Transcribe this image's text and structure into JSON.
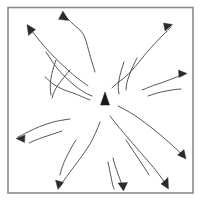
{
  "figure": {
    "background_color": "#ffffff",
    "frame": {
      "label": "square-border",
      "color": "#8a8a8a",
      "stroke_width": 1.6,
      "x": 8,
      "y": 7.5,
      "width": 185,
      "height": 185.5
    },
    "center_marker": {
      "label": "centre-triangle",
      "color": "#1a1a1a",
      "x": 105,
      "y": 103,
      "width": 9,
      "height": 13,
      "points": "105,92 109.5,105 100.5,105"
    },
    "arrow_style": {
      "stroke_color": "#3a3a3a",
      "stroke_width": 0.85,
      "head_color": "#2b2b2b",
      "count": 12
    },
    "arrows": [
      {
        "name": "arrow-north",
        "direction": "north",
        "tip": [
          63,
          12
        ],
        "path": "M 95 72 C 92 62 90 56 88 48 C 86 41 85 35 80 30 C 74 25 68 20 64 14",
        "head": "63,11 68.5,20.5 58.5,19.2"
      },
      {
        "name": "arrow-northwest",
        "direction": "northwest",
        "tip": [
          27,
          25
        ],
        "path": "M 88 86 C 80 80 74 76 68 70 C 60 63 52 55 44 46 C 39 40 33 32 28 27",
        "head": "27,24.5 35.5,29.5 28.5,35.5"
      },
      {
        "name": "arrow-northwest-inner",
        "direction": "northwest-inner",
        "tip": [
          45,
          50
        ],
        "path": "M 92 96 C 86 94 80 90 74 85 C 68 80 62 74 57 68 C 52 62 49 56 46 52",
        "head": null
      },
      {
        "name": "arrow-west-upper",
        "direction": "west-upper",
        "tip": [
          44,
          76
        ],
        "path": "M 90 100 C 84 98 79 95 73 93 C 66 91 59 88 53 84 C 49 81 47 78 45 77",
        "head": null
      },
      {
        "name": "arrow-northeast",
        "direction": "northeast",
        "tip": [
          172,
          26
        ],
        "path": "M 112 88 C 116 84 120 81 124 78 C 130 73 134 68 139 62 C 146 53 154 44 162 36 C 166 32 169 29 171 27",
        "head": "172.5,24.5 165,31 163.5,23"
      },
      {
        "name": "arrow-east",
        "direction": "east",
        "tip": [
          186,
          74
        ],
        "path": "M 142 90 C 148 88 153 85 158 84 C 164 82 169 80 174 78 C 179 76 183 75 185 74",
        "head": "187,73.5 178.5,70 179,77.5"
      },
      {
        "name": "arrow-west",
        "direction": "west",
        "tip": [
          17,
          138
        ],
        "path": "M 70 119 C 63 120 56 121 50 123 C 43 125 36 128 30 131 C 24 134 20 136 18 137",
        "head": "16,138.5 25,135 24.5,142.5"
      },
      {
        "name": "arrow-southwest",
        "direction": "southwest",
        "tip": [
          58,
          188
        ],
        "path": "M 100 122 C 97 130 94 137 90 144 C 85 152 79 160 73 168 C 67 176 62 183 59 187",
        "head": "58,189.5 55.5,180 63.5,182.5"
      },
      {
        "name": "arrow-south",
        "direction": "south",
        "tip": [
          123,
          190
        ],
        "path": "M 113 158 C 114 163 116 168 118 174 C 120 179 122 185 123 188",
        "head": "123.5,191 118,183 127.5,182.5"
      },
      {
        "name": "arrow-southeast",
        "direction": "southeast",
        "tip": [
          168,
          188
        ],
        "path": "M 110 116 C 116 124 122 131 128 138 C 134 145 141 153 148 161 C 155 169 162 178 167 186",
        "head": "168.5,189 161,184 168,177.5"
      },
      {
        "name": "arrow-southeast-outer",
        "direction": "southeast-outer",
        "tip": [
          185,
          158
        ],
        "path": "M 118 106 C 126 110 133 114 140 119 C 148 125 156 131 164 138 C 172 145 180 152 184 157",
        "head": "186,159 177.5,155 184,149.5"
      },
      {
        "name": "arrow-south-short",
        "direction": "south-short",
        "tip": [
          114,
          190
        ],
        "path": "M 108 162 C 109 167 110 172 111 177 C 112 182 113 187 114 189",
        "head": null
      }
    ],
    "branches": [
      {
        "name": "branch-upper-left-a",
        "path": "M 70 70 C 66 74 62 80 58 85 C 55 89 53 94 52 98"
      },
      {
        "name": "branch-upper-left-b",
        "path": "M 56 60 C 54 66 52 72 51 78 C 50 84 50 90 51 95"
      },
      {
        "name": "branch-upper-right-a",
        "path": "M 124 62 C 122 68 120 74 119 80 C 118 85 118 90 119 94"
      },
      {
        "name": "branch-upper-right-b",
        "path": "M 137 58 C 134 64 131 70 129 76 C 127 81 126 86 126 90"
      },
      {
        "name": "branch-lower-left-a",
        "path": "M 76 140 C 72 146 69 152 66 158 C 63 164 61 170 60 175"
      },
      {
        "name": "branch-lower-right-a",
        "path": "M 126 140 C 130 146 134 152 138 158 C 142 164 146 170 149 175"
      },
      {
        "name": "branch-east-lower",
        "path": "M 148 96 C 154 94 160 92 166 91 C 172 90 177 89 181 89"
      },
      {
        "name": "branch-west-lower",
        "path": "M 62 131 C 56 133 50 135 44 137 C 38 139 33 141 29 143"
      }
    ]
  }
}
